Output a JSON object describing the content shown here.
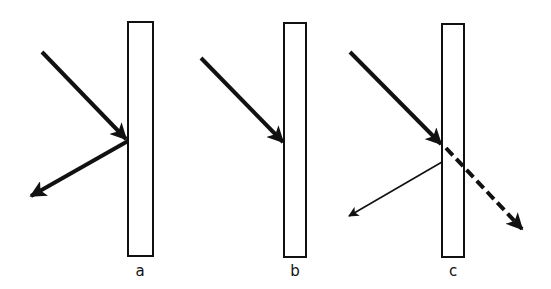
{
  "diagram": {
    "type": "ray-incidence-on-slab",
    "panels": [
      {
        "label": "a",
        "description": "Incident ray fully reflected at surface",
        "incident": "bold arrow",
        "reflected": "bold arrow",
        "transmitted": null
      },
      {
        "label": "b",
        "description": "Incident ray fully absorbed at surface",
        "incident": "bold arrow",
        "reflected": null,
        "transmitted": null
      },
      {
        "label": "c",
        "description": "Incident ray partially reflected (thin arrow) and partially transmitted (dashed arrow)",
        "incident": "bold arrow",
        "reflected": "thin arrow",
        "transmitted": "dashed arrow"
      }
    ]
  },
  "colors": {
    "stroke": "#111111",
    "background": "#ffffff"
  }
}
